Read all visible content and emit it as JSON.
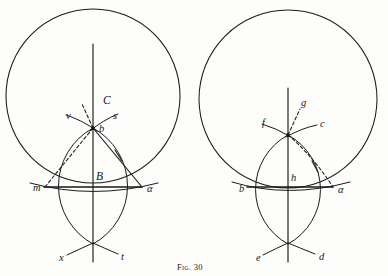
{
  "figure": {
    "caption": "Fig. 30",
    "caption_x": 194,
    "caption_y": 268,
    "background": "#fdfdfb",
    "ink_color": "#1a1a1a",
    "width": 388,
    "height": 276
  },
  "left_panel": {
    "name": "left-construction",
    "circle": {
      "cx": 93,
      "cy": 96,
      "r": 87
    },
    "vesica": {
      "left_arc_center_x": 138,
      "right_arc_center_x": 48,
      "arc_r": 66,
      "top_y": 128,
      "bottom_y": 244
    },
    "axis": {
      "x": 93,
      "y1": 44,
      "y2": 262
    },
    "chord": {
      "x1": 44,
      "x2": 142,
      "y": 187
    },
    "apex": {
      "x": 93,
      "y": 128
    },
    "labels": [
      {
        "id": "C",
        "text": "C",
        "x": 103,
        "y": 101,
        "style": "cap"
      },
      {
        "id": "v",
        "text": "v",
        "x": 70,
        "y": 117,
        "style": "low"
      },
      {
        "id": "s",
        "text": "s",
        "x": 114,
        "y": 117,
        "style": "low"
      },
      {
        "id": "b",
        "text": "b",
        "x": 100,
        "y": 128,
        "style": "low"
      },
      {
        "id": "B",
        "text": "B",
        "x": 97,
        "y": 178,
        "style": "cap"
      },
      {
        "id": "m",
        "text": "m",
        "x": 37,
        "y": 188,
        "style": "low"
      },
      {
        "id": "alpha",
        "text": "α",
        "x": 148,
        "y": 189,
        "style": "low"
      },
      {
        "id": "x",
        "text": "x",
        "x": 62,
        "y": 258,
        "style": "low"
      },
      {
        "id": "t",
        "text": "t",
        "x": 122,
        "y": 257,
        "style": "low"
      }
    ]
  },
  "right_panel": {
    "name": "right-construction",
    "circle": {
      "cx": 288,
      "cy": 99,
      "r": 89
    },
    "vesica": {
      "left_arc_center_x": 330,
      "right_arc_center_x": 246,
      "arc_r": 62,
      "top_y": 135,
      "bottom_y": 244
    },
    "axis": {
      "x": 288,
      "y1": 88,
      "y2": 262
    },
    "chord": {
      "x1": 247,
      "x2": 333,
      "y": 187
    },
    "apex": {
      "x": 288,
      "y": 135
    },
    "labels": [
      {
        "id": "g",
        "text": "g",
        "x": 300,
        "y": 105,
        "style": "low"
      },
      {
        "id": "f",
        "text": "f",
        "x": 265,
        "y": 126,
        "style": "low"
      },
      {
        "id": "c",
        "text": "c",
        "x": 320,
        "y": 126,
        "style": "low"
      },
      {
        "id": "h",
        "text": "h",
        "x": 292,
        "y": 180,
        "style": "low"
      },
      {
        "id": "b",
        "text": "b",
        "x": 241,
        "y": 189,
        "style": "low"
      },
      {
        "id": "alpha",
        "text": "α",
        "x": 340,
        "y": 190,
        "style": "low"
      },
      {
        "id": "e",
        "text": "e",
        "x": 258,
        "y": 258,
        "style": "low"
      },
      {
        "id": "d",
        "text": "d",
        "x": 320,
        "y": 257,
        "style": "low"
      }
    ]
  }
}
